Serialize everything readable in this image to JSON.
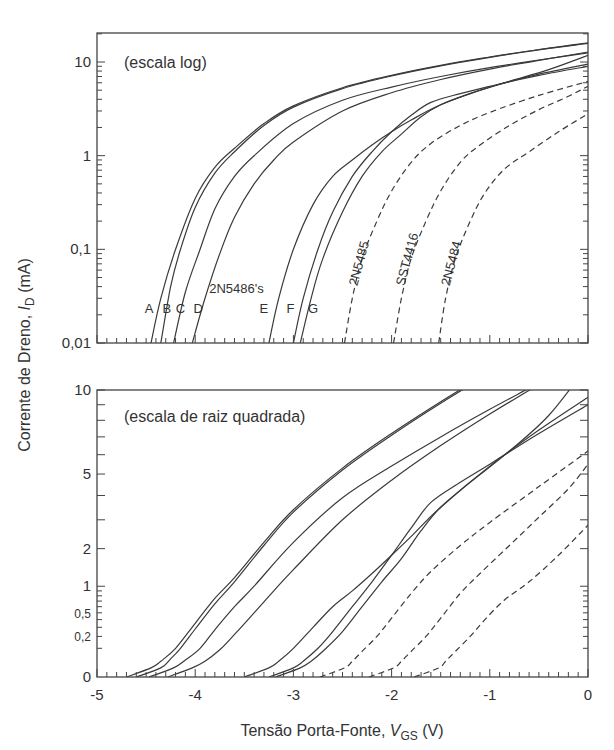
{
  "chart_data": [
    {
      "type": "line",
      "panel": "top",
      "title": "(escala log)",
      "xlabel": "Tensão Porta-Fonte, V_GS (V)",
      "ylabel": "Corrente de Dreno, I_D (mA)",
      "yscale": "log",
      "xlim": [
        -5,
        0
      ],
      "ylim": [
        0.01,
        20
      ],
      "yticks": [
        {
          "v": 10,
          "label": "10"
        },
        {
          "v": 1,
          "label": "1"
        },
        {
          "v": 0.1,
          "label": "0,1"
        },
        {
          "v": 0.01,
          "label": "0,01"
        }
      ],
      "grid": false,
      "annotations": [
        {
          "text": "A",
          "x": -4.47,
          "y": 0.021
        },
        {
          "text": "B",
          "x": -4.29,
          "y": 0.021
        },
        {
          "text": "C",
          "x": -4.15,
          "y": 0.021
        },
        {
          "text": "D",
          "x": -3.97,
          "y": 0.021
        },
        {
          "text": "2N5486's",
          "x": -3.58,
          "y": 0.034
        },
        {
          "text": "E",
          "x": -3.3,
          "y": 0.021
        },
        {
          "text": "F",
          "x": -3.03,
          "y": 0.021
        },
        {
          "text": "G",
          "x": -2.8,
          "y": 0.021
        },
        {
          "text": "2N5485",
          "x": -2.35,
          "y": 0.04,
          "rotate": -75
        },
        {
          "text": "SST4416",
          "x": -1.87,
          "y": 0.04,
          "rotate": -75
        },
        {
          "text": "2N5484",
          "x": -1.41,
          "y": 0.04,
          "rotate": -75
        }
      ]
    },
    {
      "type": "line",
      "panel": "bottom",
      "title": "(escala de raiz quadrada)",
      "yscale": "sqrt",
      "xlim": [
        -5,
        0
      ],
      "ylim": [
        0,
        10
      ],
      "yticks": [
        {
          "v": 10,
          "label": "10"
        },
        {
          "v": 5,
          "label": "5"
        },
        {
          "v": 2,
          "label": "2"
        },
        {
          "v": 1,
          "label": "1"
        },
        {
          "v": 0.5,
          "label": "0,5",
          "small": true
        },
        {
          "v": 0.2,
          "label": "0,2",
          "small": true
        },
        {
          "v": 0,
          "label": "0"
        }
      ],
      "xticks": [
        {
          "v": -5,
          "label": "-5"
        },
        {
          "v": -4,
          "label": "-4"
        },
        {
          "v": -3,
          "label": "-3"
        },
        {
          "v": -2,
          "label": "-2"
        },
        {
          "v": -1,
          "label": "-1"
        },
        {
          "v": 0,
          "label": "0"
        }
      ],
      "grid": false
    }
  ],
  "series": [
    {
      "name": "2N5486 A",
      "style": "solid",
      "points": [
        [
          -4.45,
          0.01
        ],
        [
          -4.35,
          0.03
        ],
        [
          -4.2,
          0.1
        ],
        [
          -4.0,
          0.35
        ],
        [
          -3.8,
          0.75
        ],
        [
          -3.6,
          1.2
        ],
        [
          -3.3,
          2.2
        ],
        [
          -3.0,
          3.4
        ],
        [
          -2.5,
          5.3
        ],
        [
          -2.0,
          7.2
        ],
        [
          -1.5,
          9.2
        ],
        [
          -1.0,
          11.3
        ],
        [
          -0.5,
          13.6
        ],
        [
          0,
          16
        ]
      ]
    },
    {
      "name": "2N5486 B",
      "style": "solid",
      "points": [
        [
          -4.35,
          0.01
        ],
        [
          -4.25,
          0.04
        ],
        [
          -4.15,
          0.1
        ],
        [
          -4.0,
          0.28
        ],
        [
          -3.8,
          0.65
        ],
        [
          -3.6,
          1.1
        ],
        [
          -3.3,
          2.1
        ],
        [
          -3.0,
          3.3
        ],
        [
          -2.5,
          5.2
        ],
        [
          -2.0,
          7.1
        ],
        [
          -1.5,
          9.1
        ],
        [
          -1.0,
          11.2
        ],
        [
          -0.5,
          13.5
        ],
        [
          0,
          15.8
        ]
      ]
    },
    {
      "name": "2N5486 C",
      "style": "solid",
      "points": [
        [
          -4.22,
          0.01
        ],
        [
          -4.1,
          0.035
        ],
        [
          -3.95,
          0.1
        ],
        [
          -3.8,
          0.27
        ],
        [
          -3.6,
          0.6
        ],
        [
          -3.4,
          1.0
        ],
        [
          -3.0,
          2.2
        ],
        [
          -2.5,
          3.9
        ],
        [
          -2.0,
          5.4
        ],
        [
          -1.5,
          7.0
        ],
        [
          -1.0,
          8.7
        ],
        [
          -0.5,
          10.5
        ],
        [
          0,
          12.5
        ]
      ]
    },
    {
      "name": "2N5486 D",
      "style": "solid",
      "points": [
        [
          -4.03,
          0.01
        ],
        [
          -3.9,
          0.03
        ],
        [
          -3.75,
          0.09
        ],
        [
          -3.6,
          0.22
        ],
        [
          -3.4,
          0.5
        ],
        [
          -3.2,
          0.9
        ],
        [
          -3.0,
          1.4
        ],
        [
          -2.5,
          3.0
        ],
        [
          -2.0,
          4.7
        ],
        [
          -1.5,
          6.5
        ],
        [
          -1.0,
          8.4
        ],
        [
          -0.5,
          10.4
        ],
        [
          0,
          12.8
        ]
      ]
    },
    {
      "name": "2N5486 E",
      "style": "solid",
      "points": [
        [
          -3.25,
          0.01
        ],
        [
          -3.15,
          0.03
        ],
        [
          -3.0,
          0.1
        ],
        [
          -2.8,
          0.3
        ],
        [
          -2.6,
          0.6
        ],
        [
          -2.4,
          0.9
        ],
        [
          -2.2,
          1.3
        ],
        [
          -2.0,
          1.8
        ],
        [
          -1.8,
          2.4
        ],
        [
          -1.5,
          3.5
        ],
        [
          -1.0,
          5.4
        ],
        [
          -0.5,
          7.4
        ],
        [
          0,
          9.5
        ]
      ]
    },
    {
      "name": "2N5486 F",
      "style": "solid",
      "points": [
        [
          -3.0,
          0.01
        ],
        [
          -2.9,
          0.03
        ],
        [
          -2.75,
          0.1
        ],
        [
          -2.6,
          0.25
        ],
        [
          -2.4,
          0.6
        ],
        [
          -2.2,
          1.1
        ],
        [
          -2.0,
          1.8
        ],
        [
          -1.8,
          2.7
        ],
        [
          -1.6,
          3.7
        ],
        [
          -1.3,
          4.6
        ],
        [
          -1.0,
          5.5
        ],
        [
          -0.5,
          7.2
        ],
        [
          0,
          9.0
        ]
      ]
    },
    {
      "name": "2N5486 G",
      "style": "solid",
      "points": [
        [
          -2.93,
          0.01
        ],
        [
          -2.82,
          0.03
        ],
        [
          -2.7,
          0.08
        ],
        [
          -2.5,
          0.25
        ],
        [
          -2.3,
          0.6
        ],
        [
          -2.1,
          1.1
        ],
        [
          -1.9,
          1.7
        ],
        [
          -1.7,
          2.6
        ],
        [
          -1.5,
          3.5
        ],
        [
          -1.2,
          4.6
        ],
        [
          -0.8,
          6.2
        ],
        [
          -0.4,
          8.3
        ],
        [
          0,
          11.8
        ]
      ]
    },
    {
      "name": "2N5485",
      "style": "dashed",
      "points": [
        [
          -2.48,
          0.01
        ],
        [
          -2.4,
          0.03
        ],
        [
          -2.3,
          0.08
        ],
        [
          -2.15,
          0.2
        ],
        [
          -2.0,
          0.42
        ],
        [
          -1.8,
          0.85
        ],
        [
          -1.6,
          1.35
        ],
        [
          -1.3,
          2.1
        ],
        [
          -1.0,
          2.9
        ],
        [
          -0.5,
          4.4
        ],
        [
          0,
          6.2
        ]
      ]
    },
    {
      "name": "SST4416",
      "style": "dashed",
      "points": [
        [
          -1.98,
          0.01
        ],
        [
          -1.9,
          0.03
        ],
        [
          -1.8,
          0.08
        ],
        [
          -1.65,
          0.2
        ],
        [
          -1.5,
          0.42
        ],
        [
          -1.3,
          0.85
        ],
        [
          -1.1,
          1.3
        ],
        [
          -0.8,
          2.1
        ],
        [
          -0.5,
          3.1
        ],
        [
          -0.2,
          4.3
        ],
        [
          0,
          5.5
        ]
      ]
    },
    {
      "name": "2N5484",
      "style": "dashed",
      "points": [
        [
          -1.52,
          0.01
        ],
        [
          -1.45,
          0.03
        ],
        [
          -1.35,
          0.08
        ],
        [
          -1.2,
          0.2
        ],
        [
          -1.05,
          0.4
        ],
        [
          -0.85,
          0.72
        ],
        [
          -0.6,
          1.1
        ],
        [
          -0.3,
          1.8
        ],
        [
          0,
          2.8
        ]
      ]
    }
  ],
  "axes": {
    "xlabel_main": "Tensão Porta-Fonte, ",
    "xlabel_var": "V",
    "xlabel_sub": "GS",
    "xlabel_unit": " (V)",
    "ylabel_main": "Corrente de Dreno, ",
    "ylabel_var": "I",
    "ylabel_sub": "D",
    "ylabel_unit": " (mA)"
  }
}
